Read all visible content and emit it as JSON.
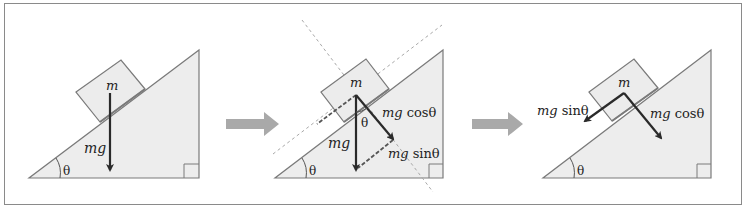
{
  "figure": {
    "panels": [
      {
        "id": "panel-1",
        "labels": {
          "mass": "m",
          "weight": "mg",
          "angle": "θ"
        }
      },
      {
        "id": "panel-2",
        "labels": {
          "mass": "m",
          "weight": "mg",
          "angle_inner": "θ",
          "angle": "θ",
          "normal_comp": "mg cosθ",
          "parallel_comp": "mg sinθ"
        },
        "normal_comp_parts": {
          "mg": "mg",
          "fn": "cosθ"
        },
        "parallel_comp_parts": {
          "mg": "mg",
          "fn": "sinθ"
        }
      },
      {
        "id": "panel-3",
        "labels": {
          "mass": "m",
          "angle": "θ",
          "normal_comp": "mg cosθ",
          "parallel_comp": "mg sinθ"
        },
        "normal_comp_parts": {
          "mg": "mg",
          "fn": "cosθ"
        },
        "parallel_comp_parts": {
          "mg": "mg",
          "fn": "sinθ"
        }
      }
    ],
    "transitions": [
      "arrow-right",
      "arrow-right"
    ],
    "colors": {
      "incline_fill": "#ededed",
      "incline_stroke": "#7a7a7a",
      "block_fill": "#ececec",
      "vector": "#2a2a2a",
      "dashed_guide": "#a8a8a8",
      "transition_arrow": "#a9a9a9",
      "frame": "#8a8a8a"
    }
  }
}
